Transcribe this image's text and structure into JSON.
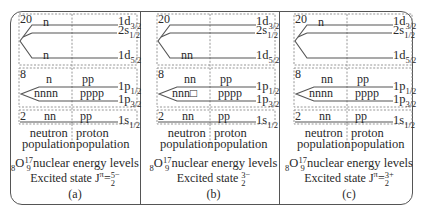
{
  "panels": [
    {
      "id": "a",
      "shells": {
        "s20": {
          "magic": "20",
          "levels": [
            {
              "name": "1d",
              "sub": "3/2",
              "neutrons": "n",
              "protons": ""
            },
            {
              "name": "2s",
              "sub": "1/2",
              "neutrons": "",
              "protons": ""
            },
            {
              "name": "1d",
              "sub": "5/2",
              "neutrons": "n",
              "protons": ""
            }
          ]
        },
        "s8": {
          "magic": "8",
          "levels": [
            {
              "name": "1p",
              "sub": "1/2",
              "neutrons": "n",
              "protons": "pp"
            },
            {
              "name": "1p",
              "sub": "3/2",
              "neutrons": "nnnn",
              "protons": "pppp"
            }
          ]
        },
        "s2": {
          "magic": "2",
          "levels": [
            {
              "name": "1s",
              "sub": "1/2",
              "neutrons": "nn",
              "protons": "pp"
            }
          ]
        }
      },
      "neutron_label_1": "neutron",
      "neutron_label_2": "population",
      "proton_label_1": "proton",
      "proton_label_2": "population",
      "title_prefix_sub": "8",
      "title_element": "O",
      "title_sup": "17",
      "title_sub": "9",
      "title_text": "nuclear energy levels",
      "state_text": "Excited state J",
      "state_pi": "π",
      "state_eq": "=",
      "state_num": "5",
      "state_den": "2",
      "state_parity": "−",
      "label": "(a)"
    },
    {
      "id": "b",
      "shells": {
        "s20": {
          "magic": "20",
          "levels": [
            {
              "name": "1d",
              "sub": "3/2",
              "neutrons": "",
              "protons": ""
            },
            {
              "name": "2s",
              "sub": "1/2",
              "neutrons": "",
              "protons": ""
            },
            {
              "name": "1d",
              "sub": "5/2",
              "neutrons": "nn",
              "protons": ""
            }
          ]
        },
        "s8": {
          "magic": "8",
          "levels": [
            {
              "name": "1p",
              "sub": "1/2",
              "neutrons": "nn",
              "protons": "pp"
            },
            {
              "name": "1p",
              "sub": "3/2",
              "neutrons": "nnn□",
              "protons": "pppp"
            }
          ]
        },
        "s2": {
          "magic": "2",
          "levels": [
            {
              "name": "1s",
              "sub": "1/2",
              "neutrons": "nn",
              "protons": "pp"
            }
          ]
        }
      },
      "neutron_label_1": "neutron",
      "neutron_label_2": "population",
      "proton_label_1": "proton",
      "proton_label_2": "population",
      "title_prefix_sub": "8",
      "title_element": "O",
      "title_sup": "17",
      "title_sub": "9",
      "title_text": "nuclear energy levels",
      "state_text": "Excited state ",
      "state_pi": "",
      "state_eq": "",
      "state_num": "3",
      "state_den": "2",
      "state_parity": "−",
      "label": "(b)"
    },
    {
      "id": "c",
      "shells": {
        "s20": {
          "magic": "20",
          "levels": [
            {
              "name": "1d",
              "sub": "3/2",
              "neutrons": "n",
              "protons": ""
            },
            {
              "name": "2s",
              "sub": "1/2",
              "neutrons": "",
              "protons": ""
            },
            {
              "name": "1d",
              "sub": "5/2",
              "neutrons": "",
              "protons": ""
            }
          ]
        },
        "s8": {
          "magic": "8",
          "levels": [
            {
              "name": "1p",
              "sub": "1/2",
              "neutrons": "nn",
              "protons": "pp"
            },
            {
              "name": "1p",
              "sub": "3/2",
              "neutrons": "nnnn",
              "protons": "pppp"
            }
          ]
        },
        "s2": {
          "magic": "2",
          "levels": [
            {
              "name": "1s",
              "sub": "1/2",
              "neutrons": "nn",
              "protons": "pp"
            }
          ]
        }
      },
      "neutron_label_1": "neutron",
      "neutron_label_2": "population",
      "proton_label_1": "proton",
      "proton_label_2": "population",
      "title_prefix_sub": "8",
      "title_element": "O",
      "title_sup": "17",
      "title_sub": "9",
      "title_text": "nuclear energy levels",
      "state_text": "Excited state J",
      "state_pi": "π",
      "state_eq": "=",
      "state_num": "3",
      "state_den": "2",
      "state_parity": "+",
      "label": "(c)"
    }
  ],
  "colors": {
    "line": "#555555",
    "text": "#2a2a2a",
    "dashed": "#8a8a8a"
  }
}
